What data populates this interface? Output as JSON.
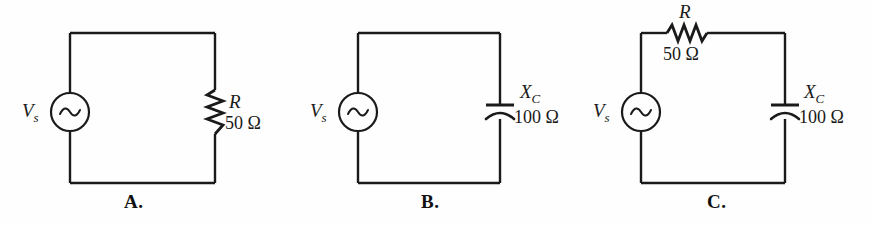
{
  "figure": {
    "background_color": "#fefefe",
    "wire_color": "#1a1a1a",
    "text_color": "#1a1a1a"
  },
  "circuits": [
    {
      "panel_letter": "A.",
      "source": {
        "symbol": "V",
        "subscript": "s",
        "icon": "ac-source-icon"
      },
      "components": [
        {
          "kind": "resistor",
          "icon": "resistor-icon",
          "orientation": "vertical",
          "symbol": "R",
          "subscript": "",
          "value": "50 Ω"
        }
      ]
    },
    {
      "panel_letter": "B.",
      "source": {
        "symbol": "V",
        "subscript": "s",
        "icon": "ac-source-icon"
      },
      "components": [
        {
          "kind": "capacitor",
          "icon": "capacitor-icon",
          "orientation": "vertical",
          "symbol": "X",
          "subscript": "C",
          "value": "100 Ω"
        }
      ]
    },
    {
      "panel_letter": "C.",
      "source": {
        "symbol": "V",
        "subscript": "s",
        "icon": "ac-source-icon"
      },
      "components": [
        {
          "kind": "resistor",
          "icon": "resistor-icon",
          "orientation": "horizontal",
          "symbol": "R",
          "subscript": "",
          "value": "50 Ω"
        },
        {
          "kind": "capacitor",
          "icon": "capacitor-icon",
          "orientation": "vertical",
          "symbol": "X",
          "subscript": "C",
          "value": "100 Ω"
        }
      ]
    }
  ]
}
